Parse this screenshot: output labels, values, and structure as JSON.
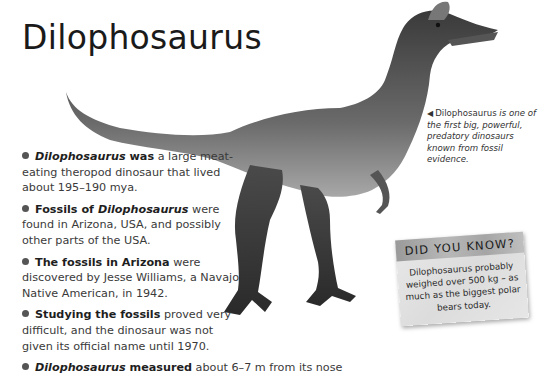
{
  "page": {
    "title": "Dilophosaurus",
    "image_subject": "dilophosaurus-illustration"
  },
  "facts": [
    {
      "lead_italic": "Dilophosaurus",
      "lead_bold": " was",
      "text": " a large meat-eating theropod dinosaur that lived about 195–190 mya."
    },
    {
      "lead_bold_prefix": "Fossils of ",
      "lead_italic": "Dilophosaurus",
      "text": " were found in Arizona, USA, and possibly other parts of the USA."
    },
    {
      "lead_bold": "The fossils in Arizona",
      "text": " were discovered by Jesse Williams, a Navajo Native American, in 1942."
    },
    {
      "lead_bold": "Studying the fossils",
      "text": " proved very difficult, and the dinosaur was not given its official name until 1970."
    },
    {
      "lead_italic": "Dilophosaurus",
      "lead_bold": " measured",
      "text": " about 6–7 m from its nose"
    }
  ],
  "caption": {
    "arrow": "◀",
    "name": "Dilophosaurus",
    "text": " is one of the first big, powerful, predatory dinosaurs known from fossil evidence."
  },
  "did_you_know": {
    "heading": "DID YOU KNOW?",
    "text": "Dilophosaurus probably weighed over 500 kg – as much as the biggest polar bears today."
  }
}
